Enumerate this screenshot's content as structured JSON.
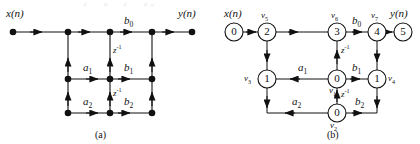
{
  "figure": {
    "subfigures": [
      {
        "caption": "(a)",
        "kind": "block-diagram"
      },
      {
        "caption": "(b)",
        "kind": "signal-flow-graph"
      }
    ]
  },
  "fig_a": {
    "caption": "(a)",
    "input_label": "x(n)",
    "output_label": "y(n)",
    "coefficients": {
      "b0": {
        "text": "b",
        "sub": "0"
      },
      "b1": {
        "text": "b",
        "sub": "1"
      },
      "b2": {
        "text": "b",
        "sub": "2"
      },
      "a1": {
        "text": "a",
        "sub": "1"
      },
      "a2": {
        "text": "a",
        "sub": "2"
      }
    },
    "delays": [
      {
        "text": "z",
        "sup": "-1"
      },
      {
        "text": "z",
        "sup": "-1"
      }
    ],
    "delay_glyph": "z⁻¹"
  },
  "fig_b": {
    "caption": "(b)",
    "input_label": "x(n)",
    "output_label": "y(n)",
    "nodes": [
      {
        "id": "n0",
        "value": "0",
        "vlabel": "",
        "row": "top",
        "col": 0
      },
      {
        "id": "n2",
        "value": "2",
        "vlabel": "v5",
        "row": "top",
        "col": 1
      },
      {
        "id": "n3",
        "value": "3",
        "vlabel": "v6",
        "row": "top",
        "col": 2
      },
      {
        "id": "n4",
        "value": "4",
        "vlabel": "v7",
        "row": "top",
        "col": 3
      },
      {
        "id": "n5",
        "value": "5",
        "vlabel": "",
        "row": "top",
        "col": 4
      },
      {
        "id": "n6",
        "value": "1",
        "vlabel": "v3",
        "row": "middle",
        "col": 1
      },
      {
        "id": "n7",
        "value": "0",
        "vlabel": "v1",
        "row": "middle",
        "col": 2
      },
      {
        "id": "n8",
        "value": "1",
        "vlabel": "v4",
        "row": "middle",
        "col": 3
      },
      {
        "id": "n9",
        "value": "0",
        "vlabel": "v2",
        "row": "bottom",
        "col": 2
      }
    ],
    "vlabels": {
      "v1": {
        "text": "v",
        "sub": "1"
      },
      "v2": {
        "text": "v",
        "sub": "2"
      },
      "v3": {
        "text": "v",
        "sub": "3"
      },
      "v4": {
        "text": "v",
        "sub": "4"
      },
      "v5": {
        "text": "v",
        "sub": "5"
      },
      "v6": {
        "text": "v",
        "sub": "6"
      },
      "v7": {
        "text": "v",
        "sub": "7"
      }
    },
    "coefficients": {
      "b0": {
        "text": "b",
        "sub": "0"
      },
      "b1": {
        "text": "b",
        "sub": "1"
      },
      "b2": {
        "text": "b",
        "sub": "2"
      },
      "a1": {
        "text": "a",
        "sub": "1"
      },
      "a2": {
        "text": "a",
        "sub": "2"
      }
    },
    "delays": [
      {
        "text": "z",
        "sup": "-1"
      },
      {
        "text": "z",
        "sup": "-1"
      }
    ],
    "delay_glyph": "z⁻¹"
  },
  "colors": {
    "ink": "#111111",
    "background": "#ffffff"
  }
}
